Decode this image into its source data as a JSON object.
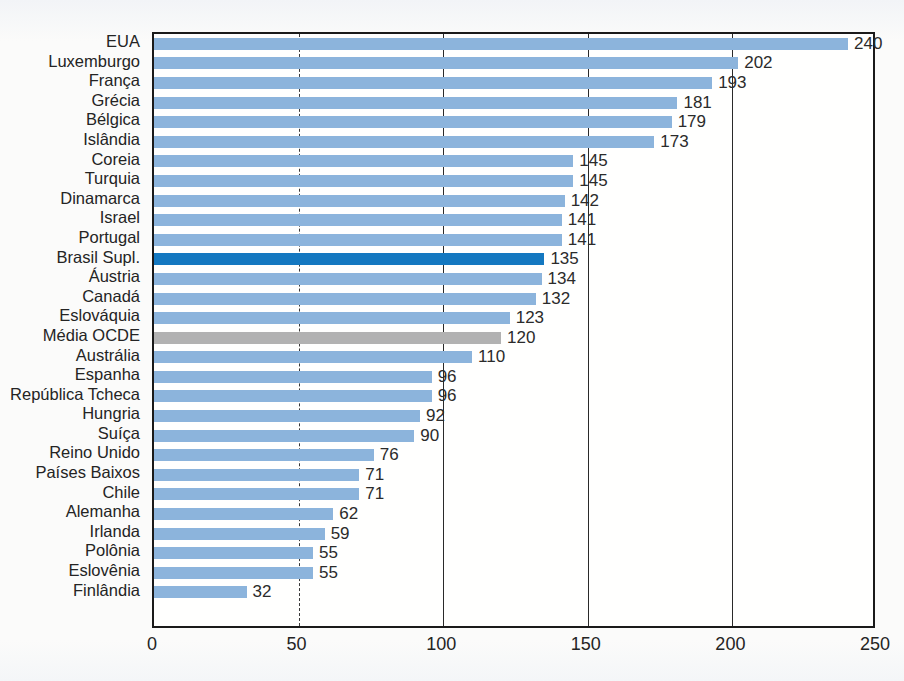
{
  "chart_data": {
    "type": "bar",
    "orientation": "horizontal",
    "title": "",
    "subtitle": "",
    "xlabel": "",
    "ylabel": "",
    "xlim": [
      0,
      250
    ],
    "xticks": [
      0,
      50,
      100,
      150,
      200,
      250
    ],
    "grid": true,
    "grid_axis": "x",
    "legend": "none",
    "categories": [
      "EUA",
      "Luxemburgo",
      "França",
      "Grécia",
      "Bélgica",
      "Islândia",
      "Coreia",
      "Turquia",
      "Dinamarca",
      "Israel",
      "Portugal",
      "Brasil Supl.",
      "Áustria",
      "Canadá",
      "Eslováquia",
      "Média OCDE",
      "Austrália",
      "Espanha",
      "República Tcheca",
      "Hungria",
      "Suíça",
      "Reino Unido",
      "Países Baixos",
      "Chile",
      "Alemanha",
      "Irlanda",
      "Polônia",
      "Eslovênia",
      "Finlândia"
    ],
    "values": [
      240,
      202,
      193,
      181,
      179,
      173,
      145,
      145,
      142,
      141,
      141,
      135,
      134,
      132,
      123,
      120,
      110,
      96,
      96,
      92,
      90,
      76,
      71,
      71,
      62,
      59,
      55,
      55,
      32
    ],
    "bar_styles": [
      "default",
      "default",
      "default",
      "default",
      "default",
      "default",
      "default",
      "default",
      "default",
      "default",
      "default",
      "highlight",
      "default",
      "default",
      "default",
      "average",
      "default",
      "default",
      "default",
      "default",
      "default",
      "default",
      "default",
      "default",
      "default",
      "default",
      "default",
      "default",
      "default"
    ]
  },
  "colors": {
    "bar_default": "#8cb4dc",
    "bar_highlight": "#1478c0",
    "bar_average": "#b2b2b2",
    "axis": "#1a1a1a",
    "text": "#242424",
    "page_background": "#fbfbfa"
  }
}
